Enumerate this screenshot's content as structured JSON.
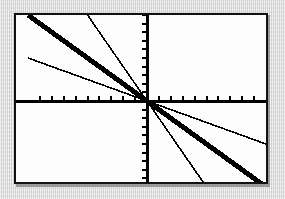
{
  "screen": {
    "device": "graphing-calculator-screen",
    "background_color": "#ffffff",
    "border_color": "#121212",
    "page_background_color": "#d9d9d9"
  },
  "chart_data": {
    "type": "line",
    "title": "",
    "subtitle": "",
    "xlabel": "",
    "ylabel": "",
    "xlim": [
      -10,
      10
    ],
    "ylim": [
      -10,
      10
    ],
    "grid": false,
    "legend": null,
    "annotations": [],
    "axes": {
      "x_axis": {
        "visible": true,
        "position_y": 0,
        "tick_spacing": 1,
        "tick_count_left": 9,
        "tick_count_right": 9,
        "tick_labels": [],
        "color": "#000000"
      },
      "y_axis": {
        "visible": true,
        "position_x": 0,
        "tick_spacing": 1,
        "tick_count_up": 10,
        "tick_count_down": 10,
        "tick_labels": [],
        "color": "#000000"
      }
    },
    "series": [
      {
        "name": "y = -0.5x",
        "slope": -0.5,
        "intercept": 0,
        "thickness": "thin",
        "stroke_width": 1.6,
        "color": "#000000",
        "x": [
          -10,
          10
        ],
        "values": [
          5,
          -5
        ]
      },
      {
        "name": "y = -x",
        "slope": -1,
        "intercept": 0,
        "thickness": "thick",
        "stroke_width": 5,
        "color": "#000000",
        "x": [
          -10,
          10
        ],
        "values": [
          10,
          -10
        ]
      },
      {
        "name": "y = -2x",
        "slope": -2,
        "intercept": 0,
        "thickness": "thin",
        "stroke_width": 1.6,
        "color": "#000000",
        "x": [
          -5,
          5
        ],
        "values": [
          10,
          -10
        ]
      }
    ]
  }
}
